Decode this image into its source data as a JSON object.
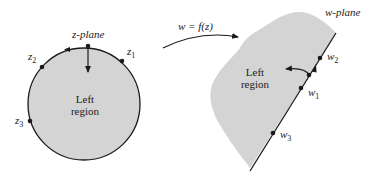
{
  "colors": {
    "region_fill": "#d4d4d4",
    "stroke": "#1a1a1a",
    "text": "#222222",
    "background": "#ffffff"
  },
  "z_plane": {
    "title": "z-plane",
    "region_label_line1": "Left",
    "region_label_line2": "region",
    "points": [
      {
        "name": "z",
        "sub": "1"
      },
      {
        "name": "z",
        "sub": "2"
      },
      {
        "name": "z",
        "sub": "3"
      }
    ]
  },
  "mapping": {
    "label": "w = f(z)"
  },
  "w_plane": {
    "title": "w-plane",
    "region_label_line1": "Left",
    "region_label_line2": "region",
    "points": [
      {
        "name": "w",
        "sub": "1"
      },
      {
        "name": "w",
        "sub": "2"
      },
      {
        "name": "w",
        "sub": "3"
      }
    ]
  }
}
